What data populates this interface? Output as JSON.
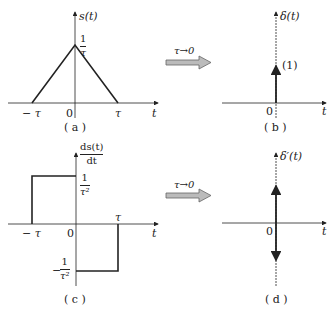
{
  "panels": {
    "a": {
      "caption": "( a )",
      "ylabel": "s(t)",
      "xlabel": "t",
      "peak_num": "1",
      "peak_den": "τ",
      "tick_neg": "− τ",
      "tick_zero": "0",
      "tick_pos": "τ"
    },
    "b": {
      "caption": "( b )",
      "ylabel": "δ(t)",
      "xlabel": "t",
      "impulse_label": "(1)",
      "tick_zero": "0"
    },
    "c": {
      "caption": "( c )",
      "ylabel_num": "ds(t)",
      "ylabel_den": "dt",
      "xlabel": "t",
      "pos_num": "1",
      "pos_den": "τ²",
      "neg_sign": "−",
      "neg_num": "1",
      "neg_den": "τ²",
      "tick_neg": "− τ",
      "tick_zero": "0",
      "tick_pos": "τ"
    },
    "d": {
      "caption": "( d )",
      "ylabel": "δ′(t)",
      "xlabel": "t",
      "tick_zero": "0"
    }
  },
  "arrows": {
    "top_label": "τ→0",
    "bottom_label": "τ→0"
  },
  "colors": {
    "line": "#222222",
    "arrow_fill": "#bbbbbb",
    "arrow_stroke": "#666666"
  }
}
